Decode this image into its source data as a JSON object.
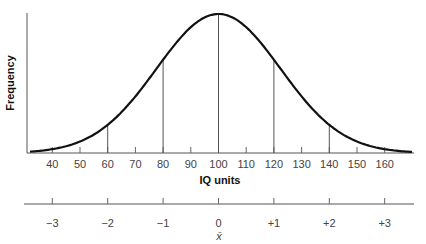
{
  "chart_data": {
    "type": "line",
    "title": "",
    "subtitle": "Normal distribution of IQ scores",
    "ylabel": "Frequency",
    "xlabel": "IQ units",
    "mean": 100,
    "x_ticks": [
      40,
      50,
      60,
      70,
      80,
      90,
      100,
      110,
      120,
      130,
      140,
      150,
      160
    ],
    "x_range": [
      30,
      170
    ],
    "vertical_lines_at": [
      60,
      80,
      100,
      120,
      140
    ],
    "curve": "normal bell curve peaking at IQ 100",
    "series": [
      {
        "name": "Frequency",
        "x": [
          40,
          50,
          60,
          70,
          80,
          90,
          100,
          110,
          120,
          130,
          140,
          150,
          160
        ],
        "values": [
          0.06,
          0.11,
          0.2,
          0.36,
          0.67,
          0.91,
          1.0,
          0.91,
          0.67,
          0.36,
          0.2,
          0.11,
          0.06
        ]
      }
    ],
    "secondary_axis": {
      "label": "standard deviations",
      "ticks": [
        "−3",
        "−2",
        "−1",
        "0",
        "+1",
        "+2",
        "+3"
      ],
      "mean_symbol": "x̄"
    },
    "grid": false,
    "legend": "none"
  },
  "labels": {
    "y_axis": "Frequency",
    "x_axis": "IQ units",
    "mean_symbol": "x̄"
  }
}
